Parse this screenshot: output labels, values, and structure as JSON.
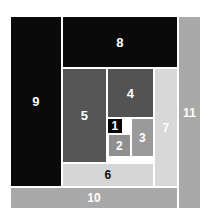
{
  "figure": {
    "background_color": "#ffffff",
    "border_color": "#ffffff",
    "canvas": {
      "width": 213,
      "height": 223
    },
    "region": {
      "left": 10,
      "top": 16,
      "width": 191,
      "height": 193
    }
  },
  "chart_data": {
    "type": "diagram",
    "subtype": "squared-square-dissection",
    "xlabel": "",
    "ylabel": "",
    "grid": false,
    "legend": "none",
    "note": "Eleven squares of differing sizes tile a larger rectangle; each tile is labelled with its rank number 1 (smallest) through 11 (largest).",
    "units": "pixels (relative to the dissected region)",
    "tiles": [
      {
        "label": "1",
        "name": "square-1",
        "x": 97,
        "y": 102,
        "w": 16,
        "h": 16,
        "color": "#050505",
        "label_color": "#ffffff",
        "shade": "black"
      },
      {
        "label": "2",
        "name": "square-2",
        "x": 98,
        "y": 118,
        "w": 23,
        "h": 23,
        "color": "#8f8f8f",
        "label_color": "#ffffff",
        "shade": "mid-gray"
      },
      {
        "label": "3",
        "name": "square-3",
        "x": 121,
        "y": 102,
        "w": 23,
        "h": 39,
        "color": "#9a9a9a",
        "label_color": "#ffffff",
        "shade": "mid-gray"
      },
      {
        "label": "4",
        "name": "square-4",
        "x": 97,
        "y": 52,
        "w": 47,
        "h": 50,
        "color": "#535353",
        "label_color": "#ffffff",
        "shade": "dark-gray"
      },
      {
        "label": "5",
        "name": "square-5",
        "x": 52,
        "y": 52,
        "w": 45,
        "h": 95,
        "color": "#565656",
        "label_color": "#ffffff",
        "shade": "dark-gray"
      },
      {
        "label": "6",
        "name": "square-6",
        "x": 52,
        "y": 147,
        "w": 92,
        "h": 24,
        "color": "#d6d6d6",
        "label_color": "#111111",
        "shade": "light-gray"
      },
      {
        "label": "7",
        "name": "square-7",
        "x": 144,
        "y": 52,
        "w": 24,
        "h": 119,
        "color": "#d8d8d8",
        "label_color": "#ffffff",
        "shade": "light-gray"
      },
      {
        "label": "8",
        "name": "square-8",
        "x": 52,
        "y": 0,
        "w": 116,
        "h": 52,
        "color": "#0a0a0a",
        "label_color": "#ffffff",
        "shade": "black"
      },
      {
        "label": "9",
        "name": "square-9",
        "x": 0,
        "y": 0,
        "w": 52,
        "h": 171,
        "color": "#0a0a0a",
        "label_color": "#ffffff",
        "shade": "black"
      },
      {
        "label": "10",
        "name": "square-10",
        "x": 0,
        "y": 171,
        "w": 168,
        "h": 22,
        "color": "#a9a9a9",
        "label_color": "#ffffff",
        "shade": "medium-gray"
      },
      {
        "label": "11",
        "name": "square-11",
        "x": 168,
        "y": 0,
        "w": 23,
        "h": 193,
        "color": "#a9a9a9",
        "label_color": "#ffffff",
        "shade": "medium-gray"
      }
    ]
  }
}
